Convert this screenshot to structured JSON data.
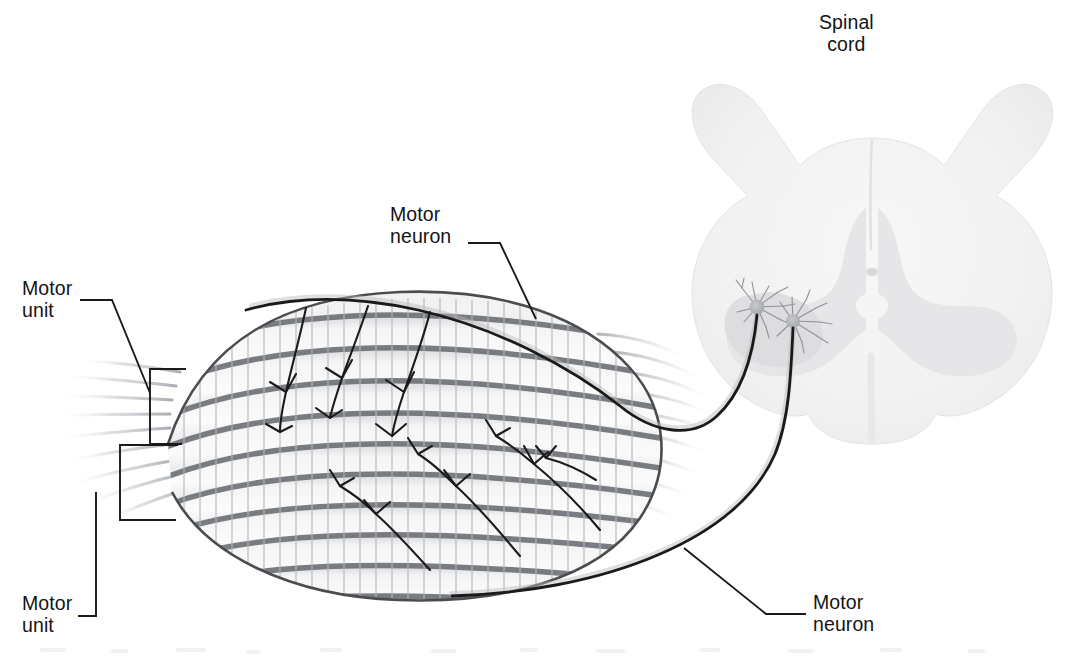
{
  "figure": {
    "background_color": "#ffffff",
    "ink_color": "#141414",
    "palette": {
      "line": "#141414",
      "muscle_band": "#6f7175",
      "muscle_fill": "#f0f0f0",
      "striation": "#b9bcc0",
      "tendon": "#c9cbcd",
      "cord_white_matter": "#f4f4f5",
      "cord_gray_matter": "#eaeaec",
      "neuron_soma": "#b2b4b8",
      "nerve": "#1a1a1a"
    }
  },
  "labels": [
    {
      "id": "spinal-cord",
      "text": "Spinal\ncord",
      "x": 819,
      "y": 11,
      "align": "center"
    },
    {
      "id": "motor-neuron-top",
      "text": "Motor\nneuron",
      "x": 390,
      "y": 203,
      "align": "left"
    },
    {
      "id": "motor-unit-top",
      "text": "Motor\nunit",
      "x": 22,
      "y": 277,
      "align": "left"
    },
    {
      "id": "motor-unit-bottom",
      "text": "Motor\nunit",
      "x": 22,
      "y": 592,
      "align": "left"
    },
    {
      "id": "motor-neuron-bottom",
      "text": "Motor\nneuron",
      "x": 813,
      "y": 591,
      "align": "left"
    }
  ],
  "leader_lines": [
    {
      "id": "leader-motor-neuron-top",
      "path": "M468,243 L500,243 L536,319"
    },
    {
      "id": "leader-motor-unit-top",
      "path": "M80,300 L112,300 L150,393"
    },
    {
      "id": "leader-motor-unit-bottom",
      "path": "M78,616 L96,616 L96,492"
    },
    {
      "id": "leader-motor-neuron-bottom",
      "path": "M684,548 L766,614 L806,614"
    }
  ],
  "brackets": [
    {
      "id": "bracket-motor-unit-top",
      "path": "M186,369 L150,369 L150,444 L182,444"
    },
    {
      "id": "bracket-motor-unit-bottom",
      "path": "M178,445 L120,445 L120,520 L176,520"
    }
  ],
  "anatomy": {
    "muscle": {
      "name": "skeletal muscle belly",
      "fiber_count": 9,
      "has_striations": true,
      "tendon_left": true,
      "tendon_right": true
    },
    "spinal_cord": {
      "name": "spinal cord cross-section",
      "shape": "butterfly gray matter within oval white matter",
      "neuron_cell_bodies": 2,
      "horn": "ventral (anterior) horn, left side"
    },
    "motor_neurons": [
      {
        "id": "motor-neuron-upper",
        "innervates": "upper motor unit",
        "axon_route": "curves over top of muscle"
      },
      {
        "id": "motor-neuron-lower",
        "innervates": "lower motor unit",
        "axon_route": "sweeps beneath muscle"
      }
    ]
  }
}
